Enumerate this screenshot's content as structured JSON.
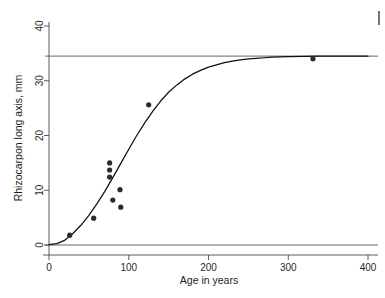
{
  "chart_data": {
    "type": "scatter",
    "title": "",
    "xlabel": "Age in years",
    "ylabel": "Rhizocarpon long axis, mm",
    "xlim": [
      0,
      400
    ],
    "ylim": [
      0,
      40
    ],
    "xticks": [
      0,
      100,
      200,
      300,
      400
    ],
    "yticks": [
      0,
      10,
      20,
      30,
      40
    ],
    "xtick_labels": [
      "0",
      "100",
      "200",
      "300",
      "400"
    ],
    "ytick_labels": [
      "0",
      "10",
      "20",
      "30",
      "40"
    ],
    "grid": false,
    "legend": "none",
    "points": [
      {
        "x": 26,
        "y": 1.8
      },
      {
        "x": 56,
        "y": 4.9
      },
      {
        "x": 76,
        "y": 15.0
      },
      {
        "x": 76,
        "y": 13.7
      },
      {
        "x": 76,
        "y": 12.4
      },
      {
        "x": 80,
        "y": 8.2
      },
      {
        "x": 89,
        "y": 10.1
      },
      {
        "x": 90,
        "y": 6.9
      },
      {
        "x": 125,
        "y": 25.6
      },
      {
        "x": 331,
        "y": 34.0
      }
    ],
    "reference_lines": [
      {
        "name": "asymptote",
        "y": 34.5,
        "orientation": "horizontal"
      },
      {
        "name": "zero-baseline",
        "y": 0.0,
        "orientation": "horizontal"
      }
    ],
    "fit_curve": {
      "name": "growth-curve",
      "model": "sigmoid",
      "asymptote": 34.5,
      "points": [
        {
          "x": 0,
          "y": 0.05
        },
        {
          "x": 10,
          "y": 0.25
        },
        {
          "x": 20,
          "y": 0.9
        },
        {
          "x": 30,
          "y": 2.1
        },
        {
          "x": 40,
          "y": 3.6
        },
        {
          "x": 50,
          "y": 5.4
        },
        {
          "x": 60,
          "y": 7.5
        },
        {
          "x": 70,
          "y": 9.8
        },
        {
          "x": 80,
          "y": 12.3
        },
        {
          "x": 90,
          "y": 14.9
        },
        {
          "x": 100,
          "y": 17.5
        },
        {
          "x": 110,
          "y": 20.0
        },
        {
          "x": 120,
          "y": 22.3
        },
        {
          "x": 130,
          "y": 24.4
        },
        {
          "x": 140,
          "y": 26.3
        },
        {
          "x": 150,
          "y": 27.9
        },
        {
          "x": 160,
          "y": 29.2
        },
        {
          "x": 170,
          "y": 30.3
        },
        {
          "x": 180,
          "y": 31.2
        },
        {
          "x": 190,
          "y": 31.9
        },
        {
          "x": 200,
          "y": 32.5
        },
        {
          "x": 210,
          "y": 32.9
        },
        {
          "x": 220,
          "y": 33.3
        },
        {
          "x": 230,
          "y": 33.6
        },
        {
          "x": 240,
          "y": 33.8
        },
        {
          "x": 250,
          "y": 34.0
        },
        {
          "x": 260,
          "y": 34.1
        },
        {
          "x": 270,
          "y": 34.2
        },
        {
          "x": 280,
          "y": 34.3
        },
        {
          "x": 290,
          "y": 34.35
        },
        {
          "x": 300,
          "y": 34.4
        },
        {
          "x": 320,
          "y": 34.45
        },
        {
          "x": 340,
          "y": 34.48
        },
        {
          "x": 360,
          "y": 34.5
        },
        {
          "x": 400,
          "y": 34.5
        }
      ]
    }
  },
  "figure": {
    "background_color": "#ffffff",
    "point_color": "#2b2b2b",
    "curve_color": "#101010",
    "axis_color": "#4a4a4a"
  }
}
